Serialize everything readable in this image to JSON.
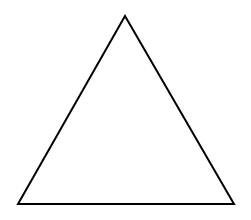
{
  "diagram": {
    "shape": "triangle",
    "vertices": [
      {
        "x": 125,
        "y": 16
      },
      {
        "x": 18,
        "y": 204
      },
      {
        "x": 234,
        "y": 204
      }
    ],
    "stroke_color": "#000000",
    "fill_color": "#ffffff",
    "stroke_width": 2,
    "background_color": "#ffffff"
  }
}
